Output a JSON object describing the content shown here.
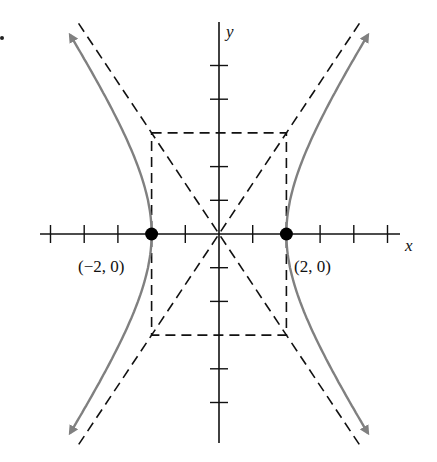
{
  "figure": {
    "type": "hyperbola-graph",
    "equation_shape": "x^2/a^2 - y^2/b^2 = 1",
    "a": 2,
    "b": 3,
    "axes": {
      "x_label": "x",
      "y_label": "y",
      "x_ticks": [
        -5,
        -4,
        -3,
        -2,
        -1,
        1,
        2,
        3,
        4,
        5
      ],
      "y_ticks": [
        -5,
        -4,
        -3,
        -2,
        -1,
        1,
        2,
        3,
        4,
        5
      ]
    },
    "vertices": [
      {
        "label": "(−2, 0)",
        "x": -2,
        "y": 0
      },
      {
        "label": "(2, 0)",
        "x": 2,
        "y": 0
      }
    ],
    "guide_box": {
      "x_min": -2,
      "x_max": 2,
      "y_min": -3,
      "y_max": 3,
      "style": "dashed"
    },
    "asymptotes": [
      {
        "slope": 1.5,
        "style": "dashed"
      },
      {
        "slope": -1.5,
        "style": "dashed"
      }
    ],
    "colors": {
      "axis": "#111111",
      "curve": "#808080",
      "dashed": "#111111",
      "vertex": "#000000"
    }
  }
}
